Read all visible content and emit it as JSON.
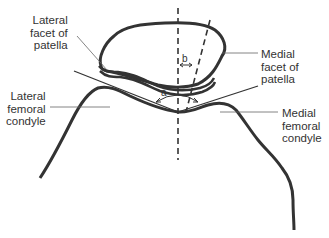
{
  "figure": {
    "labels": {
      "lateral_facet": "Lateral\nfacet of\npatella",
      "medial_facet": "Medial\nfacet of\npatella",
      "lateral_condyle": "Lateral\nfemoral\ncondyle",
      "medial_condyle": "Medial\nfemoral\ncondyle"
    },
    "angles": {
      "a": "a",
      "b": "b"
    },
    "colors": {
      "stroke": "#333333",
      "leader": "#666666",
      "background": "#ffffff"
    }
  }
}
